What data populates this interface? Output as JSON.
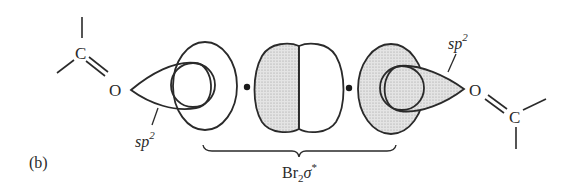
{
  "figure": {
    "label": "(b)",
    "stroke_color": "#2a2a2a",
    "shade_color": "#dcdcdc",
    "background": "#ffffff"
  },
  "left_carbonyl": {
    "carbon": "C",
    "oxygen": "O",
    "hybrid_label": "sp",
    "hybrid_sup": "2"
  },
  "right_carbonyl": {
    "carbon": "C",
    "oxygen": "O",
    "hybrid_label": "sp",
    "hybrid_sup": "2"
  },
  "bromine": {
    "orbital_label_main": "Br",
    "orbital_label_sub": "2",
    "orbital_label_sym": "σ",
    "orbital_label_sup": "*"
  }
}
